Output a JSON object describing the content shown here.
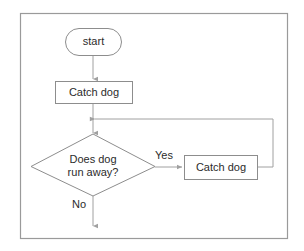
{
  "diagram": {
    "frame": {
      "name": "outer-border"
    },
    "colors": {
      "background": "#ffffff",
      "shape_stroke": "#8d8d8d",
      "connector_stroke": "#a0a0a0",
      "text": "#2b2b2b",
      "frame_stroke": "#9a9a9a"
    },
    "nodes": [
      {
        "id": "start",
        "type": "terminator",
        "label": "start",
        "lines": [
          "start"
        ]
      },
      {
        "id": "catch-dog-1",
        "type": "process",
        "label": "Catch dog",
        "lines": [
          "Catch dog"
        ]
      },
      {
        "id": "decision",
        "type": "decision",
        "label": "Does dog run away?",
        "lines": [
          "Does dog",
          "run away?"
        ]
      },
      {
        "id": "catch-dog-2",
        "type": "process",
        "label": "Catch dog",
        "lines": [
          "Catch dog"
        ]
      }
    ],
    "edges": [
      {
        "id": "start-to-catch",
        "from": "start",
        "to": "catch-dog-1",
        "label": ""
      },
      {
        "id": "catch-to-decision",
        "from": "catch-dog-1",
        "to": "decision",
        "label": ""
      },
      {
        "id": "decision-yes",
        "from": "decision",
        "to": "catch-dog-2",
        "label": "Yes"
      },
      {
        "id": "loop-back",
        "from": "catch-dog-2",
        "to": "catch-to-decision",
        "label": ""
      },
      {
        "id": "decision-no",
        "from": "decision",
        "to": "exit",
        "label": "No"
      }
    ],
    "labels": {
      "yes": "Yes",
      "no": "No"
    }
  }
}
